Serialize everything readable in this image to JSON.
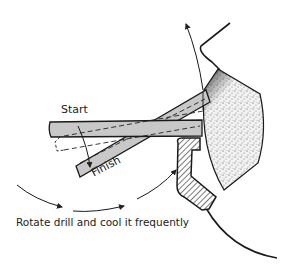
{
  "diagram": {
    "labels": {
      "start": "Start",
      "finish": "Finish"
    },
    "caption": "Rotate drill and cool it frequently",
    "parts": [
      "drill-bit-start-position",
      "drill-bit-finish-position",
      "grinding-wheel",
      "tool-rest",
      "wheel-guard",
      "rotation-arrows"
    ],
    "colors": {
      "drill_fill": "#c8c8c8",
      "outline": "#1a1a1a",
      "wheel_fill": "#e6e6e6",
      "wheel_dark_edge": "#111111"
    }
  }
}
